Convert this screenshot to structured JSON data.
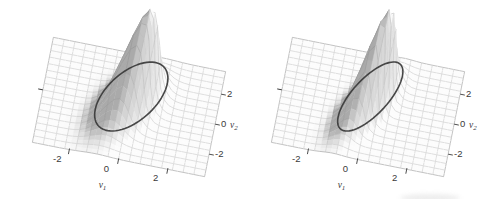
{
  "figure": {
    "background": "#ffffff",
    "kind": "two bivariate normal density surfaces with constant-density contour ellipses"
  },
  "chart_data": [
    {
      "type": "surface",
      "description": "Bivariate normal density surface (wireframe) with a constant-density contour ellipse, lower correlation",
      "xlabel": {
        "base": "v",
        "sub": "1"
      },
      "ylabel": {
        "base": "v",
        "sub": "2"
      },
      "x_ticks": [
        -2,
        0,
        2
      ],
      "y_ticks": [
        -2,
        0,
        2
      ],
      "domain": {
        "v1": [
          -3.5,
          3.5
        ],
        "v2": [
          -3.5,
          3.5
        ]
      },
      "mean": [
        0,
        0
      ],
      "sigma": [
        0.62,
        1.18
      ],
      "rho": 0.52,
      "contour_mahalanobis2": 4.45,
      "peak_height_normalized": 1,
      "grid_cells": 16,
      "surface_color": "#fcfcfc",
      "mesh_color": "#c6c6c6",
      "boundary_color": "#a9a9a9",
      "contour_color": "#383838",
      "text_color": "#3a3a3a"
    },
    {
      "type": "surface",
      "description": "Bivariate normal density surface (wireframe) with a constant-density contour ellipse, higher correlation",
      "xlabel": {
        "base": "v",
        "sub": "1"
      },
      "ylabel": {
        "base": "v",
        "sub": "2"
      },
      "x_ticks": [
        -2,
        0,
        2
      ],
      "y_ticks": [
        -2,
        0,
        2
      ],
      "domain": {
        "v1": [
          -3.5,
          3.5
        ],
        "v2": [
          -3.5,
          3.5
        ]
      },
      "mean": [
        0,
        0
      ],
      "sigma": [
        0.52,
        1.2
      ],
      "rho": 0.68,
      "contour_mahalanobis2": 4.45,
      "peak_height_normalized": 1,
      "grid_cells": 16,
      "surface_color": "#fcfcfc",
      "mesh_color": "#c6c6c6",
      "boundary_color": "#a9a9a9",
      "contour_color": "#383838",
      "text_color": "#3a3a3a"
    }
  ]
}
